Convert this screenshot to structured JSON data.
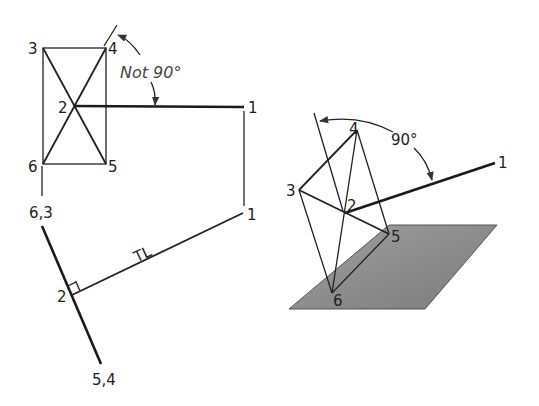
{
  "diagram": {
    "left_view": {
      "labels": {
        "p3": "3",
        "p4": "4",
        "p2": "2",
        "p6": "6",
        "p5": "5",
        "p1_top": "1",
        "p1_bottom": "1",
        "edge_63": "6,3",
        "edge_54": "5,4",
        "p2_edge": "2",
        "true_length": "TL",
        "angle_note": "Not 90°"
      }
    },
    "right_view": {
      "labels": {
        "p4": "4",
        "p3": "3",
        "p2": "2",
        "p5": "5",
        "p6": "6",
        "p1": "1",
        "angle_note": "90°"
      },
      "plane_color": "#8c8c8c"
    }
  }
}
